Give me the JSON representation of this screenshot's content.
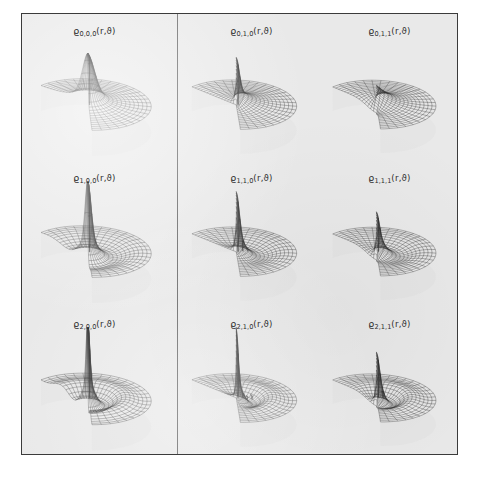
{
  "figure": {
    "background_color": "#e9e9e9",
    "frame_color": "#3b3b3b",
    "mesh_color": "#2b2b2b",
    "divider_after_column": 1
  },
  "chart_data": {
    "type": "surface",
    "title": "",
    "symbol": "ϱ",
    "arguments": "(r,ϑ)",
    "xlabel": "r",
    "ylabel": "ϑ",
    "zlabel": "ϱ",
    "grid": true,
    "legend": "none",
    "index_names": [
      "n",
      "l",
      "m"
    ],
    "row_indices": [
      0,
      1,
      2
    ],
    "column_indices": [
      [
        0,
        0
      ],
      [
        1,
        0
      ],
      [
        1,
        1
      ]
    ],
    "panels": [
      {
        "row": 0,
        "col": 0,
        "label": "ϱ",
        "subscript": "0,0,0",
        "args": "(r,ϑ)",
        "n": 0,
        "l": 0,
        "m": 0,
        "radial_nodes": 0,
        "angular_nodes": 0,
        "peak_count": 1,
        "peak_height": 0.55,
        "peak_width": "broad",
        "central_dip": false
      },
      {
        "row": 0,
        "col": 1,
        "label": "ϱ",
        "subscript": "0,1,0",
        "args": "(r,ϑ)",
        "n": 0,
        "l": 1,
        "m": 0,
        "radial_nodes": 0,
        "angular_nodes": 1,
        "peak_count": 1,
        "peak_height": 0.52,
        "peak_width": "narrow",
        "central_dip": false
      },
      {
        "row": 0,
        "col": 2,
        "label": "ϱ",
        "subscript": "0,1,1",
        "args": "(r,ϑ)",
        "n": 0,
        "l": 1,
        "m": 1,
        "radial_nodes": 0,
        "angular_nodes": 1,
        "peak_count": 0,
        "peak_height": 0.16,
        "peak_width": "flat",
        "central_dip": true
      },
      {
        "row": 1,
        "col": 0,
        "label": "ϱ",
        "subscript": "1,0,0",
        "args": "(r,ϑ)",
        "n": 1,
        "l": 0,
        "m": 0,
        "radial_nodes": 1,
        "angular_nodes": 0,
        "peak_count": 1,
        "peak_height": 0.88,
        "peak_width": "narrow",
        "central_dip": false
      },
      {
        "row": 1,
        "col": 1,
        "label": "ϱ",
        "subscript": "1,1,0",
        "args": "(r,ϑ)",
        "n": 1,
        "l": 1,
        "m": 0,
        "radial_nodes": 1,
        "angular_nodes": 1,
        "peak_count": 3,
        "peak_height": 0.74,
        "peak_width": "narrow",
        "central_dip": false
      },
      {
        "row": 1,
        "col": 2,
        "label": "ϱ",
        "subscript": "1,1,1",
        "args": "(r,ϑ)",
        "n": 1,
        "l": 1,
        "m": 1,
        "radial_nodes": 1,
        "angular_nodes": 1,
        "peak_count": 1,
        "peak_height": 0.4,
        "peak_width": "narrow",
        "central_dip": true
      },
      {
        "row": 2,
        "col": 0,
        "label": "ϱ",
        "subscript": "2,0,0",
        "args": "(r,ϑ)",
        "n": 2,
        "l": 0,
        "m": 0,
        "radial_nodes": 2,
        "angular_nodes": 0,
        "peak_count": 1,
        "peak_height": 1.0,
        "peak_width": "very narrow",
        "central_dip": false
      },
      {
        "row": 2,
        "col": 1,
        "label": "ϱ",
        "subscript": "2,1,0",
        "args": "(r,ϑ)",
        "n": 2,
        "l": 1,
        "m": 0,
        "radial_nodes": 2,
        "angular_nodes": 1,
        "peak_count": 4,
        "peak_height": 0.92,
        "peak_width": "very narrow",
        "central_dip": false
      },
      {
        "row": 2,
        "col": 2,
        "label": "ϱ",
        "subscript": "2,1,1",
        "args": "(r,ϑ)",
        "n": 2,
        "l": 1,
        "m": 1,
        "radial_nodes": 2,
        "angular_nodes": 1,
        "peak_count": 2,
        "peak_height": 0.5,
        "peak_width": "narrow",
        "central_dip": true
      }
    ]
  }
}
